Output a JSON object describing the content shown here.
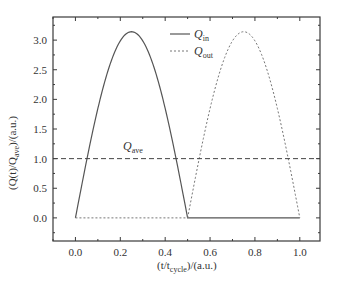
{
  "chart_data": {
    "type": "line",
    "title": "",
    "xlabel": "(t/t_cycle)/(a.u.)",
    "ylabel": "(Q(t)/Q_ave)/(a.u.)",
    "xlim": [
      -0.1,
      1.09
    ],
    "ylim": [
      -0.39,
      3.39
    ],
    "x_ticks": [
      0.0,
      0.2,
      0.4,
      0.6,
      0.8,
      1.0
    ],
    "x_tick_labels": [
      "0.0",
      "0.2",
      "0.4",
      "0.6",
      "0.8",
      "1.0"
    ],
    "x_minor_ticks": [
      -0.1,
      0.1,
      0.3,
      0.5,
      0.7,
      0.9
    ],
    "y_ticks": [
      0.0,
      0.5,
      1.0,
      1.5,
      2.0,
      2.5,
      3.0
    ],
    "y_tick_labels": [
      "0.0",
      "0.5",
      "1.0",
      "1.5",
      "2.0",
      "2.5",
      "3.0"
    ],
    "y_minor_ticks": [
      -0.25,
      0.25,
      0.75,
      1.25,
      1.75,
      2.25,
      2.75,
      3.25
    ],
    "grid": false,
    "legend_position": "upper right",
    "series": [
      {
        "name": "Q_in",
        "style": "solid",
        "description": "pi*sin(2*pi*t) for 0<=t<=0.5, 0 for 0.5<t<=1",
        "x": [
          0.0,
          0.05,
          0.1,
          0.15,
          0.2,
          0.25,
          0.3,
          0.35,
          0.4,
          0.45,
          0.5,
          1.0
        ],
        "values": [
          0.0,
          0.97,
          1.85,
          2.54,
          2.99,
          3.14,
          2.99,
          2.54,
          1.85,
          0.97,
          0.0,
          0.0
        ]
      },
      {
        "name": "Q_out",
        "style": "dotted",
        "description": "0 for 0<=t<0.5, -pi*sin(2*pi*t) for 0.5<=t<=1",
        "x": [
          0.0,
          0.5,
          0.55,
          0.6,
          0.65,
          0.7,
          0.75,
          0.8,
          0.85,
          0.9,
          0.95,
          1.0
        ],
        "values": [
          0.0,
          0.0,
          0.97,
          1.85,
          2.54,
          2.99,
          3.14,
          2.99,
          2.54,
          1.85,
          0.97,
          0.0
        ]
      },
      {
        "name": "Q_ave",
        "style": "dashed",
        "x": [
          -0.1,
          1.09
        ],
        "values": [
          1.0,
          1.0
        ]
      }
    ],
    "annotations": [
      {
        "text": "Q_ave",
        "x": 0.25,
        "y": 1.12
      }
    ]
  },
  "legend": {
    "items": [
      {
        "main": "Q",
        "sub": "in",
        "style": "solid"
      },
      {
        "main": "Q",
        "sub": "out",
        "style": "dotted"
      }
    ]
  },
  "annotation": {
    "main": "Q",
    "sub": "ave"
  },
  "axes": {
    "x_label": {
      "pre": "(t/t",
      "sub": "cycle",
      "post": ")/(a.u.)"
    },
    "y_label": {
      "pre": "(Q(t)/Q",
      "sub": "ave",
      "post": ")/(a.u.)"
    }
  },
  "colors": {
    "axis": "#3a3a3a",
    "line": "#555555"
  }
}
